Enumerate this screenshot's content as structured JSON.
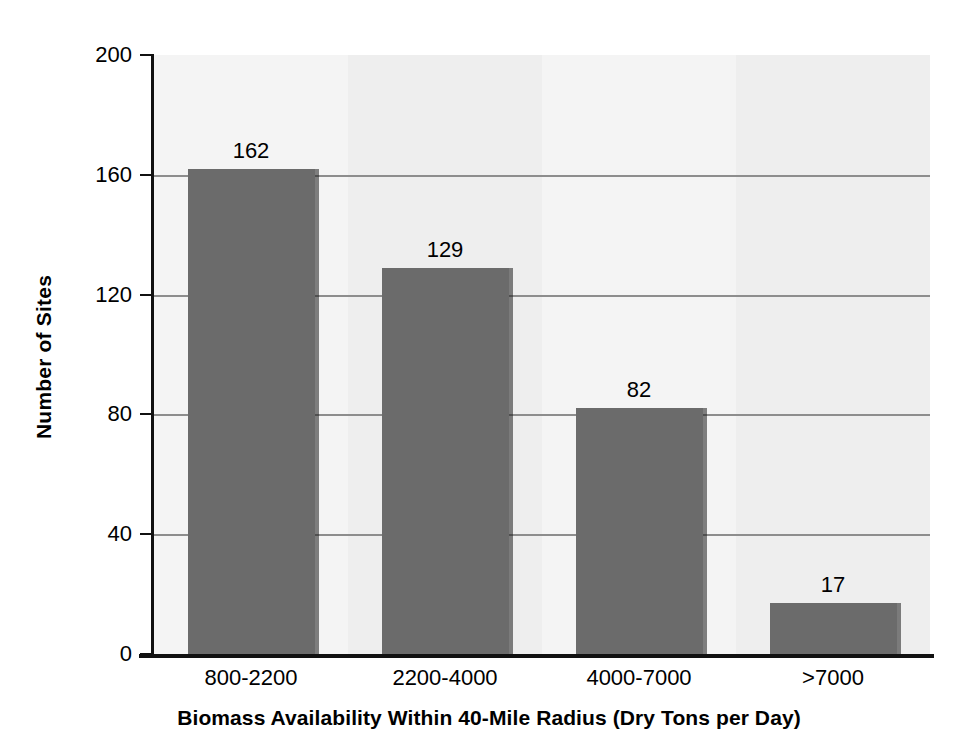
{
  "chart_data": {
    "type": "bar",
    "title": "",
    "categories": [
      "800-2200",
      "2200-4000",
      "4000-7000",
      ">7000"
    ],
    "values": [
      162,
      129,
      82,
      17
    ],
    "series": [
      {
        "name": "Number of Sites",
        "values": [
          162,
          129,
          82,
          17
        ]
      }
    ],
    "xlabel": "Biomass Availability Within 40-Mile Radius (Dry Tons per Day)",
    "ylabel": "Number of Sites",
    "ylim": [
      0,
      200
    ],
    "ytick_values": [
      0,
      40,
      80,
      120,
      160,
      200
    ],
    "ytick_labels": [
      "0",
      "40",
      "80",
      "120",
      "160",
      "200"
    ],
    "grid": true,
    "grid_axis": "y",
    "legend": false,
    "legend_position": "none",
    "bar_color": "#6b6b6b",
    "plot_background": "#f2f2f2",
    "gridline_color": "#8d8d8d",
    "axis_color": "#111111",
    "data_labels": [
      "162",
      "129",
      "82",
      "17"
    ]
  },
  "axes": {
    "y_title": "Number of Sites",
    "x_title": "Biomass Availability Within 40-Mile Radius (Dry Tons per Day)"
  },
  "y_ticks": [
    {
      "label": "200",
      "value": 200
    },
    {
      "label": "160",
      "value": 160
    },
    {
      "label": "120",
      "value": 120
    },
    {
      "label": "80",
      "value": 80
    },
    {
      "label": "40",
      "value": 40
    },
    {
      "label": "0",
      "value": 0
    }
  ],
  "bars": [
    {
      "category": "800-2200",
      "value": 162,
      "label": "162"
    },
    {
      "category": "2200-4000",
      "value": 129,
      "label": "129"
    },
    {
      "category": "4000-7000",
      "value": 82,
      "label": "82"
    },
    {
      "category": ">7000",
      "value": 17,
      "label": "17"
    }
  ]
}
